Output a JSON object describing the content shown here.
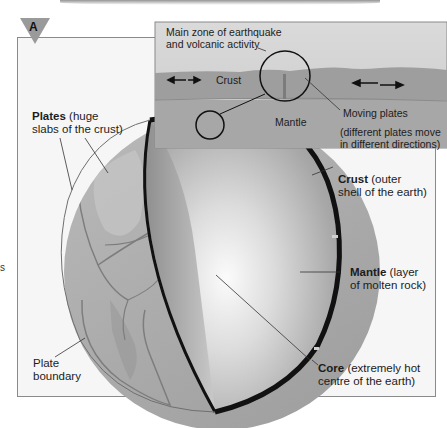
{
  "figure": {
    "marker": "A",
    "stray_char": "s"
  },
  "inset": {
    "zone_label_line1": "Main zone of earthquake",
    "zone_label_line2": "and volcanic activity",
    "crust_label": "Crust",
    "mantle_label": "Mantle",
    "moving_plates_label": "Moving plates",
    "moving_note_line1": "(different plates move",
    "moving_note_line2": "in different directions)"
  },
  "labels": {
    "plates_title": "Plates",
    "plates_desc1": " (huge",
    "plates_desc2": "slabs of the crust)",
    "crust_title": "Crust",
    "crust_desc1": " (outer",
    "crust_desc2": "shell of the earth)",
    "mantle_title": "Mantle",
    "mantle_desc1": " (layer",
    "mantle_desc2": "of molten rock)",
    "core_title": "Core",
    "core_desc1": " (extremely hot",
    "core_desc2": "centre of the earth)",
    "boundary_line1": "Plate",
    "boundary_line2": "boundary"
  },
  "colors": {
    "crust_line": "#111111",
    "globe_surface": "#a9a9a9",
    "inset_sky": "#d2d2d2",
    "inset_crust": "#9a9a9a",
    "inset_mantle": "#a6a6a6"
  }
}
